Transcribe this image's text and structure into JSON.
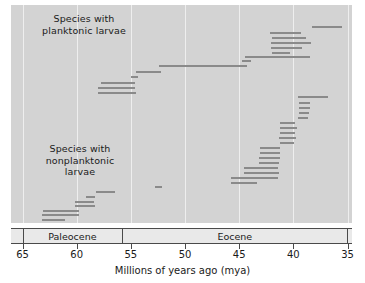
{
  "chart_data": {
    "type": "bar",
    "orientation": "horizontal-ranges",
    "title": "",
    "xlabel": "Millions of years ago (mya)",
    "ylabel": "",
    "xlim": [
      65,
      35
    ],
    "x_reversed": true,
    "xticks": [
      65,
      60,
      55,
      50,
      45,
      40,
      35
    ],
    "xtick_labels": [
      "65",
      "60",
      "55",
      "50",
      "45",
      "40",
      "35"
    ],
    "grid": "vertical",
    "legend": "none",
    "background_color": "#d3d3d3",
    "bar_color": "#8a8a8a",
    "gridline_color": "#eeeeee",
    "annotations": [
      {
        "text": "Species with\nplanktonic larvae",
        "x": 61.5,
        "y_band": "upper"
      },
      {
        "text": "Species with\nnonplanktonic\nlarvae",
        "x": 61.8,
        "y_band": "lower"
      }
    ],
    "epochs": [
      {
        "name": "Paleocene",
        "start": 65.0,
        "end": 55.8
      },
      {
        "name": "Eocene",
        "start": 55.8,
        "end": 35.0
      }
    ],
    "groups": [
      {
        "name": "Species with planktonic larvae",
        "ranges": [
          {
            "start": 38.3,
            "end": 35.5
          },
          {
            "start": 42.2,
            "end": 39.3
          },
          {
            "start": 42.0,
            "end": 38.8
          },
          {
            "start": 42.1,
            "end": 38.4
          },
          {
            "start": 42.1,
            "end": 39.2
          },
          {
            "start": 42.0,
            "end": 40.3
          },
          {
            "start": 44.5,
            "end": 38.5
          },
          {
            "start": 44.7,
            "end": 43.9
          },
          {
            "start": 52.4,
            "end": 44.3
          },
          {
            "start": 54.5,
            "end": 52.2
          },
          {
            "start": 55.0,
            "end": 54.3
          },
          {
            "start": 57.8,
            "end": 54.6
          },
          {
            "start": 58.0,
            "end": 54.6
          },
          {
            "start": 58.0,
            "end": 54.5
          }
        ]
      },
      {
        "name": "Species with nonplanktonic larvae",
        "ranges": [
          {
            "start": 39.6,
            "end": 36.8
          },
          {
            "start": 39.5,
            "end": 38.5
          },
          {
            "start": 39.5,
            "end": 38.5
          },
          {
            "start": 39.5,
            "end": 38.6
          },
          {
            "start": 39.6,
            "end": 38.6
          },
          {
            "start": 41.2,
            "end": 39.8
          },
          {
            "start": 41.2,
            "end": 39.7
          },
          {
            "start": 41.2,
            "end": 39.8
          },
          {
            "start": 41.3,
            "end": 39.8
          },
          {
            "start": 41.2,
            "end": 39.9
          },
          {
            "start": 43.1,
            "end": 41.2
          },
          {
            "start": 43.1,
            "end": 41.2
          },
          {
            "start": 43.2,
            "end": 41.2
          },
          {
            "start": 43.2,
            "end": 41.3
          },
          {
            "start": 44.6,
            "end": 41.4
          },
          {
            "start": 44.6,
            "end": 41.3
          },
          {
            "start": 45.8,
            "end": 41.4
          },
          {
            "start": 45.8,
            "end": 43.4
          },
          {
            "start": 52.8,
            "end": 52.1
          },
          {
            "start": 58.2,
            "end": 56.5
          },
          {
            "start": 59.1,
            "end": 58.3
          },
          {
            "start": 60.2,
            "end": 58.4
          },
          {
            "start": 60.2,
            "end": 58.3
          },
          {
            "start": 63.1,
            "end": 59.8
          },
          {
            "start": 63.2,
            "end": 59.8
          },
          {
            "start": 63.2,
            "end": 61.1
          }
        ]
      }
    ]
  },
  "axis": {
    "title": "Millions of years ago (mya)"
  }
}
